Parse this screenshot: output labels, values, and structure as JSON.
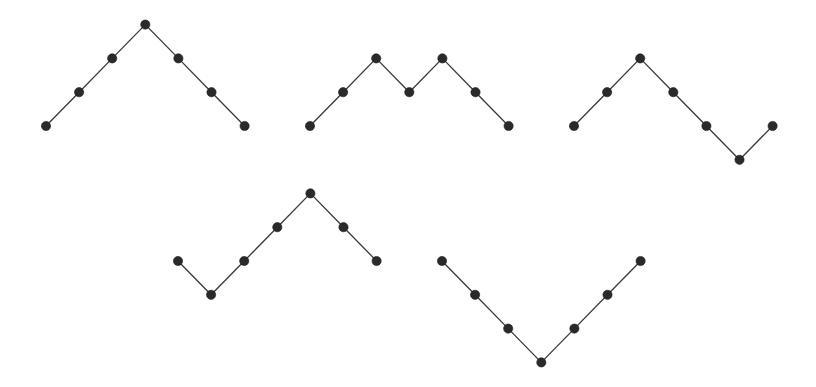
{
  "diagram": {
    "colors": {
      "line": "#3a3a3a",
      "dot": "#2a2a2a",
      "background": "#ffffff"
    },
    "grid": {
      "dx": 33.1,
      "dy": 33.8
    },
    "dot_radius": 4.6,
    "paths": [
      {
        "id": "path-1",
        "steps": "UUUDDD",
        "origin": [
          46,
          126
        ]
      },
      {
        "id": "path-2",
        "steps": "UUDUDD",
        "origin": [
          310,
          126
        ]
      },
      {
        "id": "path-3",
        "steps": "UUDDDU",
        "origin": [
          574,
          126
        ]
      },
      {
        "id": "path-4",
        "steps": "DUUUDD",
        "origin": [
          178,
          261
        ]
      },
      {
        "id": "path-5",
        "steps": "DDDUUU",
        "origin": [
          442,
          261
        ]
      }
    ]
  }
}
